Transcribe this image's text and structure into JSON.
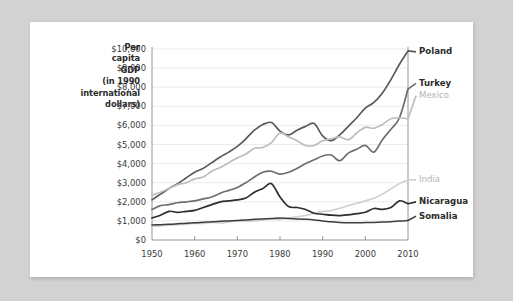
{
  "page": {
    "background_color": "#d2d2d2",
    "card_color": "#ffffff"
  },
  "chart_data": {
    "type": "line",
    "title": "Per capita GDP (in 1990 international dollars)",
    "title_lines": [
      "Per",
      "capita",
      "GDP",
      "(in 1990",
      "international",
      "dollars)"
    ],
    "xlabel": "",
    "ylabel": "Per capita GDP (in 1990 international dollars)",
    "xlim": [
      1950,
      2010
    ],
    "ylim": [
      0,
      10000
    ],
    "grid": true,
    "legend_position": "right-inline",
    "y_ticks": [
      0,
      1000,
      2000,
      3000,
      4000,
      5000,
      6000,
      7000,
      8000,
      9000,
      10000
    ],
    "y_ticklabels": [
      "$0",
      "$1,000",
      "$2,000",
      "$3,000",
      "$4,000",
      "$5,000",
      "$6,000",
      "$7,000",
      "$8,000",
      "$9,000",
      "$10,000"
    ],
    "x_ticks": [
      1950,
      1960,
      1970,
      1980,
      1990,
      2000,
      2010
    ],
    "x_ticklabels": [
      "1950",
      "1960",
      "1970",
      "1980",
      "1990",
      "2000",
      "2010"
    ],
    "x": [
      1950,
      1952,
      1954,
      1956,
      1958,
      1960,
      1962,
      1964,
      1966,
      1968,
      1970,
      1972,
      1974,
      1976,
      1978,
      1980,
      1982,
      1984,
      1986,
      1988,
      1990,
      1992,
      1994,
      1996,
      1998,
      2000,
      2002,
      2004,
      2006,
      2008,
      2010
    ],
    "series": [
      {
        "name": "Poland",
        "color": "#5a5a5a",
        "width": 1.7,
        "label_color": "#2b2b2b",
        "label_y": 9850,
        "values": [
          2100,
          2400,
          2700,
          2950,
          3250,
          3550,
          3750,
          4050,
          4350,
          4600,
          4900,
          5300,
          5750,
          6050,
          6150,
          5700,
          5500,
          5750,
          5950,
          6100,
          5450,
          5200,
          5500,
          5950,
          6400,
          6900,
          7200,
          7700,
          8400,
          9200,
          9900
        ]
      },
      {
        "name": "Turkey",
        "color": "#6e6e6e",
        "width": 1.7,
        "label_color": "#2b2b2b",
        "label_y": 8200,
        "values": [
          1600,
          1800,
          1850,
          1950,
          2000,
          2050,
          2150,
          2250,
          2450,
          2600,
          2750,
          3000,
          3300,
          3550,
          3600,
          3450,
          3550,
          3750,
          4000,
          4200,
          4400,
          4450,
          4150,
          4550,
          4750,
          4950,
          4600,
          5250,
          5800,
          6400,
          7900
        ]
      },
      {
        "name": "Mexico",
        "color": "#bdbdbd",
        "width": 1.7,
        "label_color": "#b4b4b4",
        "label_y": 7550,
        "values": [
          2350,
          2500,
          2700,
          2900,
          3000,
          3200,
          3300,
          3600,
          3800,
          4050,
          4300,
          4500,
          4800,
          4850,
          5100,
          5600,
          5400,
          5200,
          4950,
          4950,
          5200,
          5300,
          5400,
          5250,
          5600,
          5900,
          5850,
          6050,
          6350,
          6400,
          6350
        ]
      },
      {
        "name": "India",
        "color": "#cfcfcf",
        "width": 1.6,
        "label_color": "#b4b4b4",
        "label_y": 3150,
        "values": [
          720,
          740,
          780,
          800,
          830,
          860,
          870,
          920,
          890,
          940,
          1000,
          980,
          1000,
          1050,
          1100,
          1080,
          1150,
          1220,
          1280,
          1400,
          1500,
          1540,
          1660,
          1800,
          1920,
          2050,
          2180,
          2400,
          2680,
          2950,
          3150
        ]
      },
      {
        "name": "Nicaragua",
        "color": "#2e2e2e",
        "width": 1.7,
        "label_color": "#2b2b2b",
        "label_y": 2000,
        "values": [
          1150,
          1300,
          1500,
          1450,
          1500,
          1550,
          1700,
          1850,
          2000,
          2050,
          2100,
          2200,
          2500,
          2700,
          2950,
          2250,
          1750,
          1700,
          1600,
          1400,
          1350,
          1300,
          1280,
          1320,
          1380,
          1450,
          1650,
          1600,
          1700,
          2050,
          1900
        ]
      },
      {
        "name": "Somalia",
        "color": "#3d3d3d",
        "width": 1.5,
        "label_color": "#2b2b2b",
        "label_y": 1250,
        "values": [
          780,
          800,
          820,
          850,
          880,
          900,
          930,
          960,
          980,
          1000,
          1020,
          1050,
          1080,
          1100,
          1120,
          1150,
          1120,
          1100,
          1080,
          1050,
          1000,
          950,
          920,
          900,
          900,
          910,
          920,
          940,
          960,
          990,
          1020
        ]
      }
    ]
  }
}
